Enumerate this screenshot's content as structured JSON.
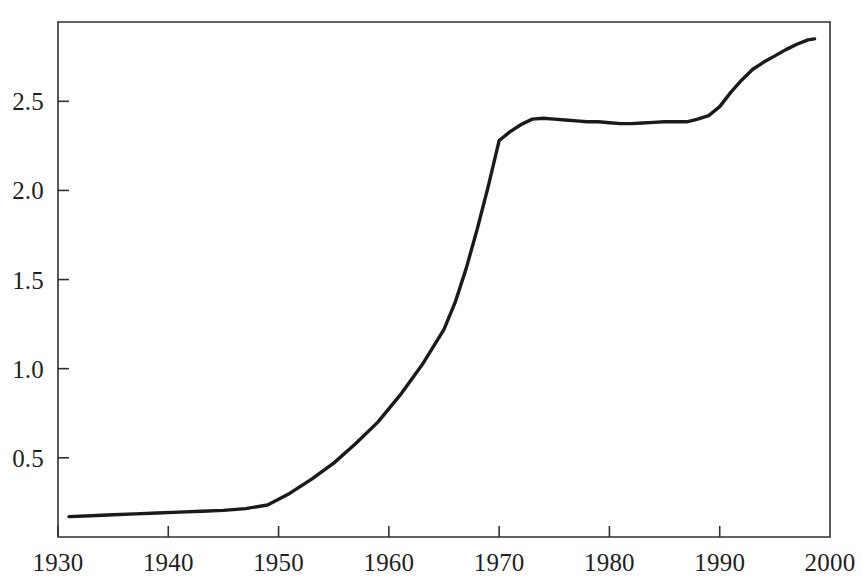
{
  "chart_data": {
    "type": "line",
    "title": "",
    "subtitle": "",
    "xlabel": "",
    "ylabel": "",
    "xlim": [
      1930,
      2000
    ],
    "ylim": [
      0.0555,
      2.945
    ],
    "grid": false,
    "legend": "none",
    "line_color": "#1a1a1a",
    "axis_color": "#303030",
    "background_color": "#ffffff",
    "x_ticks": [
      1930,
      1940,
      1950,
      1960,
      1970,
      1980,
      1990,
      2000
    ],
    "x_tick_labels": [
      "1930",
      "1940",
      "1950",
      "1960",
      "1970",
      "1980",
      "1990",
      "2000"
    ],
    "y_ticks": [
      0.5,
      1.0,
      1.5,
      2.0,
      2.5
    ],
    "y_tick_labels": [
      "0.5",
      "1.0",
      "1.5",
      "2.0",
      "2.5"
    ],
    "series": [
      {
        "name": "series-1",
        "x": [
          1931,
          1933,
          1935,
          1937,
          1939,
          1941,
          1943,
          1945,
          1947,
          1949,
          1951,
          1953,
          1955,
          1957,
          1959,
          1961,
          1963,
          1965,
          1966,
          1967,
          1968,
          1969,
          1970,
          1971,
          1972,
          1973,
          1974,
          1975,
          1976,
          1977,
          1978,
          1979,
          1980,
          1981,
          1982,
          1983,
          1984,
          1985,
          1986,
          1987,
          1988,
          1989,
          1990,
          1991,
          1992,
          1993,
          1994,
          1995,
          1996,
          1997,
          1998,
          1998.6
        ],
        "y": [
          0.17,
          0.175,
          0.18,
          0.185,
          0.19,
          0.195,
          0.2,
          0.205,
          0.215,
          0.235,
          0.3,
          0.38,
          0.47,
          0.58,
          0.7,
          0.85,
          1.02,
          1.22,
          1.37,
          1.56,
          1.78,
          2.02,
          2.28,
          2.33,
          2.37,
          2.4,
          2.405,
          2.4,
          2.395,
          2.39,
          2.385,
          2.385,
          2.38,
          2.375,
          2.375,
          2.378,
          2.382,
          2.385,
          2.385,
          2.385,
          2.4,
          2.42,
          2.47,
          2.55,
          2.62,
          2.68,
          2.72,
          2.755,
          2.79,
          2.82,
          2.845,
          2.85
        ]
      }
    ]
  }
}
